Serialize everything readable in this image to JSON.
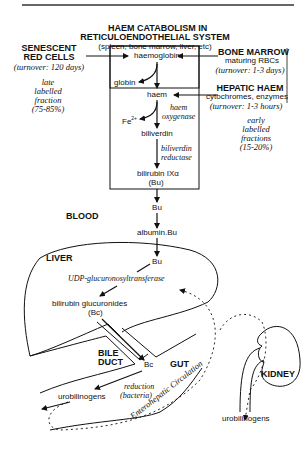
{
  "title": {
    "line1": "HAEM CATABOLISM IN",
    "line2": "RETICULOENDOTHELIAL SYSTEM",
    "subtitle": "(spleen, bone marrow, liver, etc)"
  },
  "sources": {
    "senescent": {
      "line1": "SENESCENT",
      "line2": "RED CELLS",
      "turnover": "(turnover: 120 days)",
      "fraction": [
        "late",
        "labelled",
        "fraction",
        "(75-85%)"
      ]
    },
    "bone_marrow": {
      "title": "BONE MARROW",
      "desc": "maturing RBCs",
      "turnover": "(turnover: 1-3 days)"
    },
    "hepatic_haem": {
      "title": "HEPATIC HAEM",
      "desc": "cytochromes, enzymes",
      "turnover": "(turnover: 1-3 hours)"
    },
    "early_fraction": [
      "early",
      "labelled",
      "fractions",
      "(15-20%)"
    ]
  },
  "pathway": {
    "haemoglobin": "haemoglobin",
    "globin": "globin",
    "haem": "haem",
    "haem_oxygenase": [
      "haem",
      "oxygenase"
    ],
    "fe": "Fe",
    "fe_sup": "2+",
    "biliverdin": "biliverdin",
    "biliverdin_reductase": [
      "biliverdin",
      "reductase"
    ],
    "bilirubin": "bilirubin  IXα",
    "bu_paren": "(Bu)",
    "bu": "Bu",
    "albumin_bu": "albumin.Bu",
    "liver_bu": "Bu",
    "udp": "UDP-glucuronosyltransferase",
    "glucuronides": "bilirubin  glucuronides",
    "bc_paren": "(Bc)",
    "bc": "Bc",
    "reduction": [
      "reduction",
      "(bacteria)"
    ],
    "urobilinogens_gut": "urobilinogens",
    "urobilinogens_kidney": "urobilinogens"
  },
  "compartments": {
    "blood": "BLOOD",
    "liver": "LIVER",
    "bile_duct": [
      "BILE",
      "DUCT"
    ],
    "gut": "GUT",
    "kidney": "KIDNEY",
    "enterohepatic": "Enterohepatic  Circulation"
  }
}
